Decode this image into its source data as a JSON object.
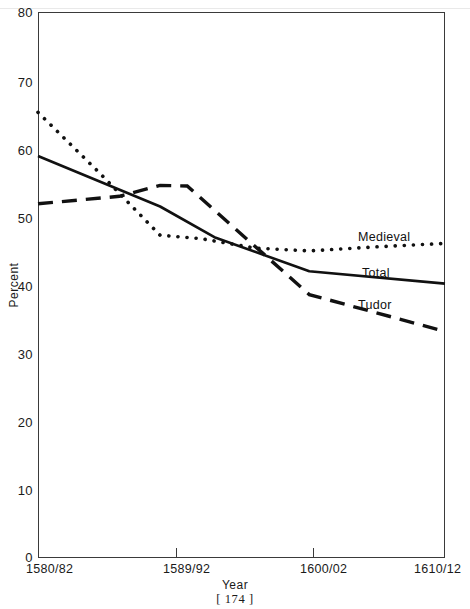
{
  "figure": {
    "page_number": "[ 174 ]"
  },
  "chart_data": {
    "type": "line",
    "title": "",
    "xlabel": "Year",
    "ylabel": "Percent",
    "grid": false,
    "legend_position": "inline-right",
    "categories": [
      "1580/82",
      "1589/92",
      "1600/02",
      "1610/12"
    ],
    "x": [
      1580,
      1589,
      1600,
      1610
    ],
    "xlim": [
      1580,
      1610
    ],
    "ylim": [
      0,
      80
    ],
    "yticks": [
      0,
      10,
      20,
      30,
      40,
      50,
      60,
      70,
      80
    ],
    "ytick_labels": [
      "0",
      "10",
      "20",
      "30",
      "40",
      "50",
      "60",
      "70",
      "80"
    ],
    "xtick_labels": [
      "1580/82",
      "1589/92",
      "1600/02",
      "1610/12"
    ],
    "series": [
      {
        "name": "Medieval",
        "style": "dotted",
        "color": "#111111",
        "x": [
          1580,
          1584.5,
          1589,
          1592,
          1596,
          1600,
          1605,
          1610
        ],
        "values": [
          65.3,
          56.5,
          47.3,
          46.8,
          45.4,
          45.0,
          45.6,
          46.1
        ]
      },
      {
        "name": "Total",
        "style": "solid",
        "color": "#111111",
        "x": [
          1580,
          1589,
          1593,
          1600,
          1610
        ],
        "values": [
          58.9,
          51.5,
          47.0,
          42.0,
          40.2
        ]
      },
      {
        "name": "Tudor",
        "style": "dashed",
        "color": "#111111",
        "x": [
          1580,
          1586,
          1589,
          1591,
          1600,
          1610
        ],
        "values": [
          51.9,
          53.0,
          54.6,
          54.5,
          38.6,
          33.2
        ]
      }
    ],
    "annotations": [
      {
        "text": "Medieval",
        "series": "Medieval"
      },
      {
        "text": "Total",
        "series": "Total"
      },
      {
        "text": "Tudor",
        "series": "Tudor"
      }
    ]
  }
}
